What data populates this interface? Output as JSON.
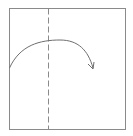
{
  "diagram": {
    "type": "origami-fold-step",
    "paper": {
      "shape": "square",
      "stroke": "#8a8a8a"
    },
    "fold_line": {
      "style": "dashed",
      "orientation": "vertical",
      "stroke": "#8a8a8a"
    },
    "fold_arrow": {
      "shape": "curved-arc",
      "direction": "left-to-right",
      "stroke": "#6e6e6e"
    }
  }
}
